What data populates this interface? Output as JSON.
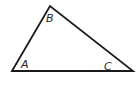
{
  "diagram": {
    "type": "triangle",
    "stroke_color": "#1a1a1a",
    "vertices": [
      {
        "name": "A",
        "x": 12,
        "y": 71,
        "label_x": 21,
        "label_y": 68
      },
      {
        "name": "B",
        "x": 50,
        "y": 6,
        "label_x": 46,
        "label_y": 22
      },
      {
        "name": "C",
        "x": 133,
        "y": 71,
        "label_x": 104,
        "label_y": 70
      }
    ],
    "labels": {
      "a": "A",
      "b": "B",
      "c": "C"
    }
  }
}
